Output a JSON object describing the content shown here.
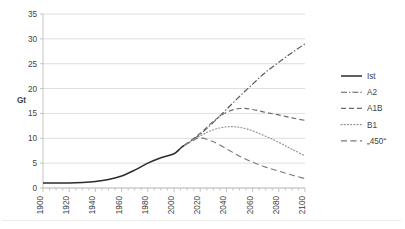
{
  "chart_data": {
    "type": "line",
    "title": "",
    "xlabel": "",
    "ylabel": "Gt",
    "xlim": [
      1900,
      2100
    ],
    "ylim": [
      0,
      35
    ],
    "ytick_step": 5,
    "xtick_step": 20,
    "grid": "horizontal",
    "legend_position": "right",
    "ytick_labels": [
      "0",
      "5",
      "10",
      "15",
      "20",
      "25",
      "30",
      "35"
    ],
    "xtick_labels": [
      "1900",
      "1920",
      "1940",
      "1960",
      "1980",
      "2000",
      "2020",
      "2040",
      "2060",
      "2080",
      "2100"
    ],
    "series": [
      {
        "name": "Ist",
        "style": "solid",
        "color": "#2b2b2b",
        "x": [
          1900,
          1910,
          1920,
          1930,
          1940,
          1950,
          1960,
          1970,
          1980,
          1990,
          2000,
          2005,
          2008
        ],
        "values": [
          1.0,
          1.0,
          1.0,
          1.1,
          1.3,
          1.7,
          2.4,
          3.6,
          5.0,
          6.1,
          6.9,
          8.0,
          8.6
        ]
      },
      {
        "name": "A2",
        "style": "dash-dot",
        "color": "#5a5a5a",
        "x": [
          2008,
          2020,
          2030,
          2040,
          2050,
          2060,
          2070,
          2080,
          2090,
          2100
        ],
        "values": [
          8.6,
          10.8,
          13.2,
          15.8,
          18.4,
          20.9,
          23.3,
          25.3,
          27.2,
          29.0
        ]
      },
      {
        "name": "A1B",
        "style": "dashed",
        "color": "#6b6b6b",
        "x": [
          2008,
          2020,
          2030,
          2040,
          2050,
          2060,
          2070,
          2080,
          2090,
          2100
        ],
        "values": [
          8.6,
          11.0,
          13.4,
          15.2,
          16.0,
          15.8,
          15.2,
          14.7,
          14.1,
          13.6
        ]
      },
      {
        "name": "B1",
        "style": "dotted",
        "color": "#8f8f8f",
        "x": [
          2008,
          2020,
          2030,
          2040,
          2050,
          2060,
          2070,
          2080,
          2090,
          2100
        ],
        "values": [
          8.6,
          10.5,
          11.7,
          12.3,
          12.2,
          11.5,
          10.4,
          9.2,
          7.8,
          6.5
        ]
      },
      {
        "name": "„450“",
        "style": "long-dash",
        "color": "#7a7a7a",
        "x": [
          2008,
          2015,
          2020,
          2030,
          2040,
          2050,
          2060,
          2070,
          2080,
          2090,
          2100
        ],
        "values": [
          8.6,
          9.6,
          10.1,
          9.3,
          7.9,
          6.4,
          5.2,
          4.2,
          3.4,
          2.6,
          1.9
        ]
      }
    ]
  },
  "legend": {
    "items": [
      {
        "label": "Ist"
      },
      {
        "label": "A2"
      },
      {
        "label": "A1B"
      },
      {
        "label": "B1"
      },
      {
        "label": "„450“"
      }
    ]
  }
}
